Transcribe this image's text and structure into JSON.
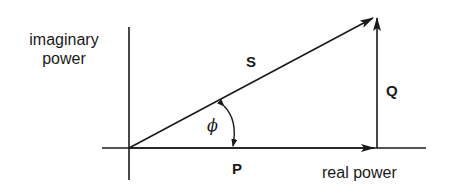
{
  "diagram": {
    "y_axis_label_line1": "imaginary",
    "y_axis_label_line2": "power",
    "x_axis_label": "real power",
    "vectors": {
      "S": "S",
      "P": "P",
      "Q": "Q"
    },
    "angle_label": "ϕ",
    "colors": {
      "stroke": "#1a1a1a",
      "background": "#ffffff"
    }
  }
}
